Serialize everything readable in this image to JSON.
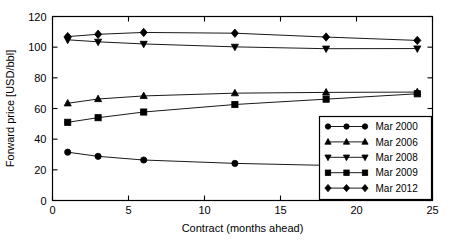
{
  "chart_data": {
    "type": "line",
    "title": "",
    "xlabel": "Contract (months ahead)",
    "ylabel": "Forward price [USD/bbl]",
    "xlim": [
      0,
      25
    ],
    "ylim": [
      0,
      120
    ],
    "xticks": [
      0,
      5,
      10,
      15,
      20,
      25
    ],
    "yticks": [
      0,
      20,
      40,
      60,
      80,
      100,
      120
    ],
    "xtick_labels": [
      "0",
      "5",
      "10",
      "15",
      "20",
      "25"
    ],
    "ytick_labels": [
      "0",
      "20",
      "40",
      "60",
      "80",
      "100",
      "120"
    ],
    "grid": false,
    "legend_position": "lower right",
    "x": [
      1,
      3,
      6,
      12,
      18,
      24
    ],
    "series": [
      {
        "name": "Mar 2000",
        "marker": "circle",
        "color": "#000000",
        "values": [
          31.5,
          28.8,
          26.4,
          24.2,
          22.9,
          22.2
        ]
      },
      {
        "name": "Mar 2006",
        "marker": "triangle-up",
        "color": "#000000",
        "values": [
          63.4,
          66.2,
          68.2,
          70.0,
          70.5,
          70.7
        ]
      },
      {
        "name": "Mar 2008",
        "marker": "triangle-down",
        "color": "#000000",
        "values": [
          104.8,
          103.5,
          102.1,
          100.2,
          99.0,
          99.1
        ]
      },
      {
        "name": "Mar 2009",
        "marker": "square",
        "color": "#000000",
        "values": [
          51.0,
          54.0,
          57.7,
          62.6,
          66.1,
          69.6
        ]
      },
      {
        "name": "Mar 2012",
        "marker": "diamond",
        "color": "#000000",
        "values": [
          106.9,
          108.4,
          109.6,
          109.1,
          106.6,
          104.4
        ]
      }
    ]
  },
  "legend": {
    "entries": [
      {
        "label": "Mar 2000",
        "marker": "circle"
      },
      {
        "label": "Mar 2006",
        "marker": "triangle-up"
      },
      {
        "label": "Mar 2008",
        "marker": "triangle-down"
      },
      {
        "label": "Mar 2009",
        "marker": "square"
      },
      {
        "label": "Mar 2012",
        "marker": "diamond"
      }
    ]
  }
}
